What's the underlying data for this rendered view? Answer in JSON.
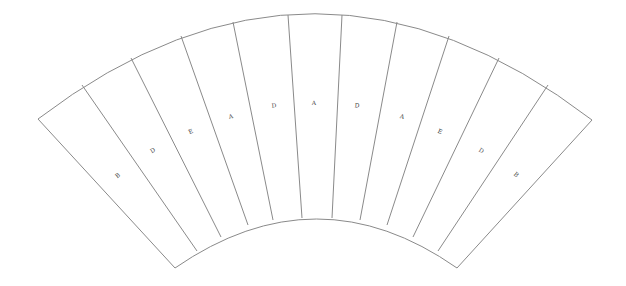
{
  "diagram": {
    "type": "annular-sector-segments",
    "segment_count": 10,
    "colors": {
      "stroke": "#8a8a8a",
      "label": "#444444",
      "background": "#ffffff"
    },
    "outer_arc": {
      "start": [
        38,
        119
      ],
      "apex": [
        315,
        14
      ],
      "end": [
        592,
        120
      ]
    },
    "inner_arc": {
      "start": [
        175,
        268
      ],
      "apex": [
        317,
        218
      ],
      "end": [
        457,
        268
      ]
    },
    "segments": [
      {
        "label": "B",
        "label_pos": [
          118,
          176
        ],
        "rotate": -40
      },
      {
        "label": "D",
        "label_pos": [
          153,
          151
        ],
        "rotate": -32
      },
      {
        "label": "E",
        "label_pos": [
          191,
          132
        ],
        "rotate": -23
      },
      {
        "label": "A",
        "label_pos": [
          231,
          117
        ],
        "rotate": -14
      },
      {
        "label": "D",
        "label_pos": [
          274,
          106
        ],
        "rotate": -5
      },
      {
        "label": "A",
        "label_pos": [
          314,
          103
        ],
        "rotate": 0
      },
      {
        "label": "D",
        "label_pos": [
          357,
          106
        ],
        "rotate": 5
      },
      {
        "label": "A",
        "label_pos": [
          402,
          117
        ],
        "rotate": 14
      },
      {
        "label": "E",
        "label_pos": [
          440,
          132
        ],
        "rotate": 23
      },
      {
        "label": "D",
        "label_pos": [
          481,
          151
        ],
        "rotate": 32
      },
      {
        "label": "B",
        "label_pos": [
          516,
          175
        ],
        "rotate": 40
      }
    ],
    "dividers": [
      {
        "outer": [
          82,
          85
        ],
        "inner": [
          197,
          251
        ]
      },
      {
        "outer": [
          131,
          58
        ],
        "inner": [
          221,
          237
        ]
      },
      {
        "outer": [
          181,
          36
        ],
        "inner": [
          248,
          225
        ]
      },
      {
        "outer": [
          233,
          22
        ],
        "inner": [
          273,
          220
        ]
      },
      {
        "outer": [
          288,
          15
        ],
        "inner": [
          302,
          218
        ]
      },
      {
        "outer": [
          342,
          15
        ],
        "inner": [
          332,
          218
        ]
      },
      {
        "outer": [
          397,
          22
        ],
        "inner": [
          360,
          220
        ]
      },
      {
        "outer": [
          449,
          36
        ],
        "inner": [
          387,
          225
        ]
      },
      {
        "outer": [
          499,
          58
        ],
        "inner": [
          413,
          237
        ]
      },
      {
        "outer": [
          548,
          85
        ],
        "inner": [
          438,
          251
        ]
      }
    ]
  }
}
